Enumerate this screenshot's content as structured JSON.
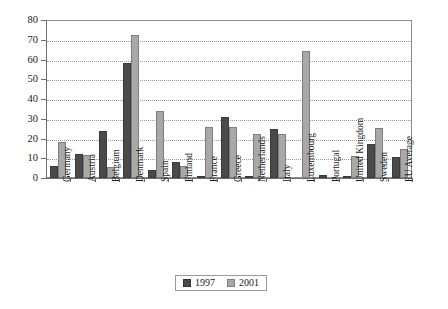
{
  "chart_data": {
    "type": "bar",
    "title": "",
    "subtitle": "",
    "xlabel": "",
    "ylabel": "",
    "ylim": [
      0,
      80
    ],
    "ytick_step": 10,
    "yticks": [
      0,
      10,
      20,
      30,
      40,
      50,
      60,
      70,
      80
    ],
    "grid": true,
    "grid_axis": "y",
    "legend_position": "bottom-center",
    "categories": [
      "Germany",
      "Austria",
      "Belgium",
      "Denmark",
      "Spain",
      "Finland",
      "France",
      "Greece",
      "Netherlands",
      "Italy",
      "Luxembourg",
      "Portugal",
      "United Kingdom",
      "Sweden",
      "EU Average"
    ],
    "series": [
      {
        "name": "1997",
        "color": "#4a4a4a",
        "values": [
          6,
          12,
          24,
          58,
          4,
          8,
          1,
          31,
          1,
          25,
          0,
          1.5,
          0.5,
          17,
          10.5
        ]
      },
      {
        "name": "2001",
        "color": "#a8a8a8",
        "values": [
          18,
          11.5,
          5.5,
          72.5,
          34,
          6,
          26,
          26,
          22.5,
          22.5,
          64.5,
          0,
          11,
          25.5,
          14.5
        ]
      }
    ]
  },
  "legend": {
    "entries": [
      {
        "label": "1997",
        "color": "#4a4a4a"
      },
      {
        "label": "2001",
        "color": "#a8a8a8"
      }
    ]
  },
  "colors": {
    "series_1997": "#4a4a4a",
    "series_2001": "#a8a8a8",
    "axis": "#6f6f6f",
    "grid": "#9a9a9a",
    "background": "#ffffff",
    "text": "#1a1a1a"
  }
}
